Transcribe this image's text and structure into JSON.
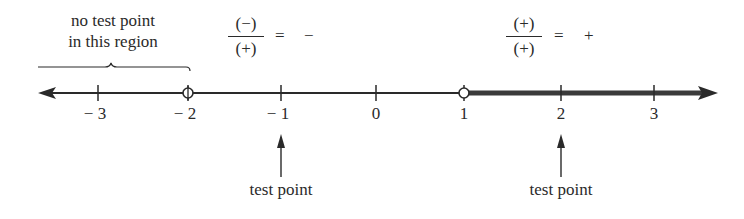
{
  "annotations": {
    "no_test_region": {
      "line1": "no test point",
      "line2": "in this region"
    },
    "left_fraction": {
      "numerator": "(−)",
      "denominator": "(+)",
      "equals": "=",
      "result": "−"
    },
    "right_fraction": {
      "numerator": "(+)",
      "denominator": "(+)",
      "equals": "=",
      "result": "+"
    },
    "test_point_left": "test point",
    "test_point_right": "test point"
  },
  "number_line": {
    "ticks": [
      {
        "value": -3,
        "label": "− 3"
      },
      {
        "value": -2,
        "label": "− 2"
      },
      {
        "value": -1,
        "label": "− 1"
      },
      {
        "value": 0,
        "label": "0"
      },
      {
        "value": 1,
        "label": "1"
      },
      {
        "value": 2,
        "label": "2"
      },
      {
        "value": 3,
        "label": "3"
      }
    ],
    "open_points": [
      -2,
      1
    ],
    "shaded_interval": {
      "from": 1,
      "to": "infinity"
    },
    "test_points": [
      -1,
      2
    ],
    "colors": {
      "line": "#2a2a2a",
      "shaded": "#3a3a3a"
    }
  }
}
